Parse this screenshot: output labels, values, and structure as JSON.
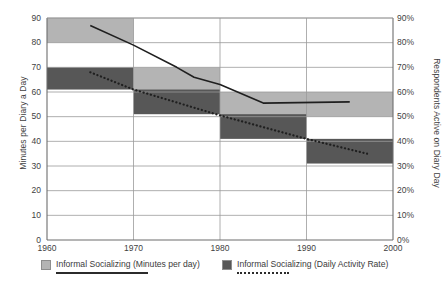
{
  "chart_data": {
    "type": "bar",
    "title": "",
    "subtitle": "",
    "xlabel": "",
    "ylabel": "Minutes per Diary a Day",
    "ylabel_right": "Respondents Active on Diary Day",
    "xlim": [
      1960,
      2000
    ],
    "ylim": [
      0,
      90
    ],
    "ylim_right": [
      0,
      90
    ],
    "grid": true,
    "legend_position": "bottom",
    "x_ticks": [
      "1960",
      "1970",
      "1980",
      "1990",
      "2000"
    ],
    "x_tick_values": [
      1960,
      1970,
      1980,
      1990,
      2000
    ],
    "y_ticks_left": [
      "0",
      "10",
      "20",
      "30",
      "40",
      "50",
      "60",
      "70",
      "80",
      "90"
    ],
    "y_tick_values_left": [
      0,
      10,
      20,
      30,
      40,
      50,
      60,
      70,
      80,
      90
    ],
    "y_ticks_right": [
      "0%",
      "10%",
      "20%",
      "30%",
      "40%",
      "50%",
      "60%",
      "70%",
      "80%",
      "90%"
    ],
    "y_tick_values_right": [
      0,
      10,
      20,
      30,
      40,
      50,
      60,
      70,
      80,
      90
    ],
    "series": [
      {
        "name": "Informal Socializing (Minutes per day)",
        "type": "band",
        "color": "#b4b4b4",
        "axis": "left",
        "bands": [
          {
            "x0": 1960,
            "x1": 1970,
            "y0": 80,
            "y1": 90
          },
          {
            "x0": 1970,
            "x1": 1980,
            "y0": 60,
            "y1": 70
          },
          {
            "x0": 1980,
            "x1": 2000,
            "y0": 50,
            "y1": 60
          }
        ]
      },
      {
        "name": "Informal Socializing (Daily Activity Rate)",
        "type": "band",
        "color": "#575757",
        "axis": "right",
        "bands": [
          {
            "x0": 1960,
            "x1": 1970,
            "y0": 61,
            "y1": 70
          },
          {
            "x0": 1970,
            "x1": 1980,
            "y0": 51,
            "y1": 61
          },
          {
            "x0": 1980,
            "x1": 1990,
            "y0": 41,
            "y1": 51
          },
          {
            "x0": 1990,
            "x1": 2000,
            "y0": 31,
            "y1": 41
          }
        ]
      },
      {
        "name": "Informal Socializing (Minutes per day) trend",
        "type": "line",
        "style": "solid",
        "color": "#1f1f1f",
        "axis": "left",
        "points": [
          {
            "x": 1965,
            "y": 87
          },
          {
            "x": 1970,
            "y": 79
          },
          {
            "x": 1975,
            "y": 70
          },
          {
            "x": 1977,
            "y": 66
          },
          {
            "x": 1980,
            "y": 63
          },
          {
            "x": 1985,
            "y": 55.5
          },
          {
            "x": 1995,
            "y": 56
          }
        ]
      },
      {
        "name": "Informal Socializing (Daily Activity Rate) trend",
        "type": "line",
        "style": "dotted",
        "color": "#1f1f1f",
        "axis": "right",
        "points": [
          {
            "x": 1965,
            "y": 68
          },
          {
            "x": 1970,
            "y": 61
          },
          {
            "x": 1980,
            "y": 50.5
          },
          {
            "x": 1990,
            "y": 41
          },
          {
            "x": 1997,
            "y": 35
          }
        ]
      }
    ]
  },
  "axes": {
    "left_title": "Minutes per Diary a Day",
    "right_title": "Respondents Active on Diary Day"
  },
  "legend": {
    "items": [
      {
        "label": "Informal Socializing (Minutes per day)",
        "swatch": "#b4b4b4",
        "line": "solid"
      },
      {
        "label": "Informal Socializing (Daily Activity Rate)",
        "swatch": "#575757",
        "line": "dotted"
      }
    ]
  }
}
